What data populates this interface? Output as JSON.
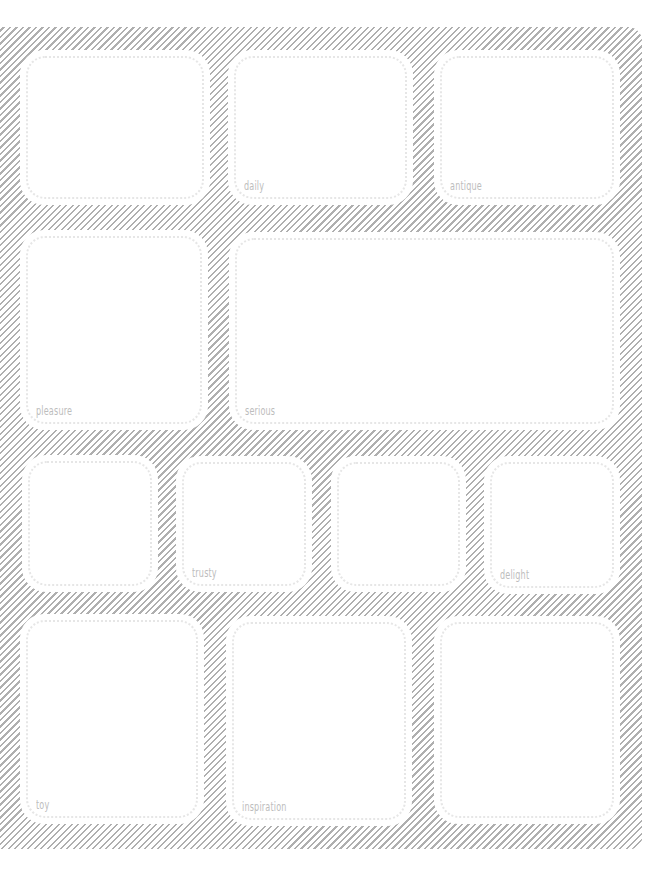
{
  "page": {
    "background": "#ffffff",
    "hatch_color": "#a9a9a9",
    "label_color": "#bdbdbd"
  },
  "rows": [
    {
      "boxes": [
        {
          "label": ""
        },
        {
          "label": "daily"
        },
        {
          "label": "antique"
        }
      ]
    },
    {
      "boxes": [
        {
          "label": "pleasure"
        },
        {
          "label": "serious"
        }
      ]
    },
    {
      "boxes": [
        {
          "label": ""
        },
        {
          "label": "trusty"
        },
        {
          "label": ""
        },
        {
          "label": "delight"
        }
      ]
    },
    {
      "boxes": [
        {
          "label": "toy"
        },
        {
          "label": "inspiration"
        },
        {
          "label": ""
        }
      ]
    }
  ]
}
